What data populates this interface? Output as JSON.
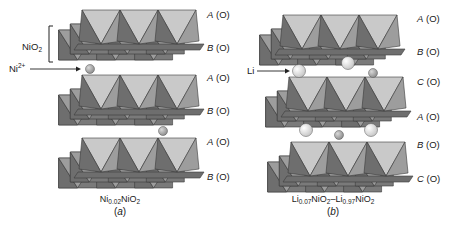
{
  "colors": {
    "top_face": "#c9c9c9",
    "front_light": "#9d9d9d",
    "front_dark": "#6e6e6e",
    "back_layer": "#7a7a7a",
    "edge": "#3a3a3a",
    "ni_atom": "#8a8a8a",
    "li_atom": "#ececec"
  },
  "panel_a": {
    "caption": {
      "base": "Ni",
      "sub": "0.02",
      "rest": "NiO",
      "rest_sub": "2"
    },
    "label": "a",
    "bracket_label": {
      "base": "NiO",
      "sub": "2"
    },
    "arrow_label": {
      "base": "Ni",
      "sup": "2+"
    },
    "stacking_labels": [
      {
        "letter": "A",
        "site": "(O)"
      },
      {
        "letter": "B",
        "site": "(O)"
      },
      {
        "letter": "A",
        "site": "(O)"
      },
      {
        "letter": "B",
        "site": "(O)"
      },
      {
        "letter": "A",
        "site": "(O)"
      },
      {
        "letter": "B",
        "site": "(O)"
      }
    ]
  },
  "panel_b": {
    "caption": {
      "base1": "Li",
      "sub1": "0.07",
      "mid": "NiO",
      "mid_sub": "2",
      "dash": "–",
      "base2": "Li",
      "sub2": "0.97",
      "rest": "NiO",
      "rest_sub": "2"
    },
    "label": "b",
    "arrow_label": "Li",
    "stacking_labels": [
      {
        "letter": "A",
        "site": "(O)"
      },
      {
        "letter": "B",
        "site": "(O)"
      },
      {
        "letter": "C",
        "site": "(O)"
      },
      {
        "letter": "A",
        "site": "(O)"
      },
      {
        "letter": "B",
        "site": "(O)"
      },
      {
        "letter": "C",
        "site": "(O)"
      }
    ]
  },
  "layers": [
    {
      "panel": "a",
      "x": 82,
      "y": 10,
      "shift": -18
    },
    {
      "panel": "a",
      "x": 82,
      "y": 75,
      "shift": -18
    },
    {
      "panel": "a",
      "x": 82,
      "y": 138,
      "shift": -18
    },
    {
      "panel": "b",
      "x": 283,
      "y": 15,
      "shift": -18
    },
    {
      "panel": "b",
      "x": 289,
      "y": 77,
      "shift": -18
    },
    {
      "panel": "b",
      "x": 291,
      "y": 142,
      "shift": -18
    }
  ],
  "atoms": [
    {
      "type": "ni",
      "cx": 90,
      "cy": 69,
      "r": 4.5
    },
    {
      "type": "ni",
      "cx": 163,
      "cy": 131,
      "r": 4.5
    },
    {
      "type": "li",
      "cx": 299,
      "cy": 71,
      "r": 6.5
    },
    {
      "type": "li",
      "cx": 348,
      "cy": 63,
      "r": 6.5
    },
    {
      "type": "ni",
      "cx": 373,
      "cy": 73,
      "r": 4.5
    },
    {
      "type": "li",
      "cx": 306,
      "cy": 130,
      "r": 6.5
    },
    {
      "type": "li",
      "cx": 371,
      "cy": 130,
      "r": 6.5
    },
    {
      "type": "ni",
      "cx": 339,
      "cy": 135,
      "r": 4.5
    }
  ]
}
